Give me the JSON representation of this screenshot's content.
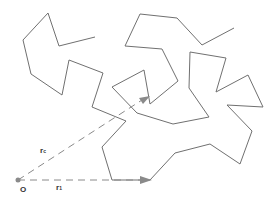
{
  "diagram": {
    "origin_label": "O",
    "vector_rc": {
      "label": "r",
      "sub": "c"
    },
    "vector_r1": {
      "label": "r",
      "sub": "1"
    },
    "colors": {
      "chain": "#707070",
      "vector": "#8a8a8a",
      "text": "#333333"
    }
  }
}
